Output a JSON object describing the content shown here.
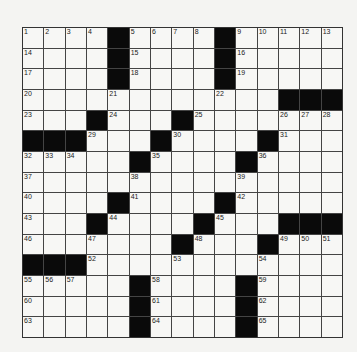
{
  "puzzle": {
    "rows": 15,
    "cols": 15,
    "black": [
      [
        4,
        9
      ],
      [
        4,
        9
      ],
      [
        4,
        9
      ],
      [
        12,
        13,
        14
      ],
      [
        3,
        7
      ],
      [
        0,
        1,
        2,
        6,
        11
      ],
      [
        5,
        10
      ],
      [],
      [
        4,
        9
      ],
      [
        3,
        8,
        12,
        13,
        14
      ],
      [
        7,
        11
      ],
      [
        0,
        1,
        2
      ],
      [
        5,
        10
      ],
      [
        5,
        10
      ],
      [
        5,
        10
      ]
    ],
    "numbers": [
      {
        "r": 0,
        "c": 0,
        "n": "1"
      },
      {
        "r": 0,
        "c": 1,
        "n": "2"
      },
      {
        "r": 0,
        "c": 2,
        "n": "3"
      },
      {
        "r": 0,
        "c": 3,
        "n": "4"
      },
      {
        "r": 0,
        "c": 5,
        "n": "5"
      },
      {
        "r": 0,
        "c": 6,
        "n": "6"
      },
      {
        "r": 0,
        "c": 7,
        "n": "7"
      },
      {
        "r": 0,
        "c": 8,
        "n": "8"
      },
      {
        "r": 0,
        "c": 10,
        "n": "9"
      },
      {
        "r": 0,
        "c": 11,
        "n": "10"
      },
      {
        "r": 0,
        "c": 12,
        "n": "11"
      },
      {
        "r": 0,
        "c": 13,
        "n": "12"
      },
      {
        "r": 0,
        "c": 14,
        "n": "13"
      },
      {
        "r": 1,
        "c": 0,
        "n": "14"
      },
      {
        "r": 1,
        "c": 5,
        "n": "15"
      },
      {
        "r": 1,
        "c": 10,
        "n": "16"
      },
      {
        "r": 2,
        "c": 0,
        "n": "17"
      },
      {
        "r": 2,
        "c": 5,
        "n": "18"
      },
      {
        "r": 2,
        "c": 10,
        "n": "19"
      },
      {
        "r": 3,
        "c": 0,
        "n": "20"
      },
      {
        "r": 3,
        "c": 4,
        "n": "21"
      },
      {
        "r": 3,
        "c": 9,
        "n": "22"
      },
      {
        "r": 4,
        "c": 0,
        "n": "23"
      },
      {
        "r": 4,
        "c": 4,
        "n": "24"
      },
      {
        "r": 4,
        "c": 8,
        "n": "25"
      },
      {
        "r": 4,
        "c": 12,
        "n": "26"
      },
      {
        "r": 4,
        "c": 13,
        "n": "27"
      },
      {
        "r": 4,
        "c": 14,
        "n": "28"
      },
      {
        "r": 5,
        "c": 3,
        "n": "29"
      },
      {
        "r": 5,
        "c": 7,
        "n": "30"
      },
      {
        "r": 5,
        "c": 12,
        "n": "31"
      },
      {
        "r": 6,
        "c": 0,
        "n": "32"
      },
      {
        "r": 6,
        "c": 1,
        "n": "33"
      },
      {
        "r": 6,
        "c": 2,
        "n": "34"
      },
      {
        "r": 6,
        "c": 6,
        "n": "35"
      },
      {
        "r": 6,
        "c": 11,
        "n": "36"
      },
      {
        "r": 7,
        "c": 0,
        "n": "37"
      },
      {
        "r": 7,
        "c": 5,
        "n": "38"
      },
      {
        "r": 7,
        "c": 10,
        "n": "39"
      },
      {
        "r": 8,
        "c": 0,
        "n": "40"
      },
      {
        "r": 8,
        "c": 5,
        "n": "41"
      },
      {
        "r": 8,
        "c": 10,
        "n": "42"
      },
      {
        "r": 9,
        "c": 0,
        "n": "43"
      },
      {
        "r": 9,
        "c": 4,
        "n": "44"
      },
      {
        "r": 9,
        "c": 9,
        "n": "45"
      },
      {
        "r": 10,
        "c": 0,
        "n": "46"
      },
      {
        "r": 10,
        "c": 3,
        "n": "47"
      },
      {
        "r": 10,
        "c": 8,
        "n": "48"
      },
      {
        "r": 10,
        "c": 12,
        "n": "49"
      },
      {
        "r": 10,
        "c": 13,
        "n": "50"
      },
      {
        "r": 10,
        "c": 14,
        "n": "51"
      },
      {
        "r": 11,
        "c": 3,
        "n": "52"
      },
      {
        "r": 11,
        "c": 7,
        "n": "53"
      },
      {
        "r": 11,
        "c": 11,
        "n": "54"
      },
      {
        "r": 12,
        "c": 0,
        "n": "55"
      },
      {
        "r": 12,
        "c": 1,
        "n": "56"
      },
      {
        "r": 12,
        "c": 2,
        "n": "57"
      },
      {
        "r": 12,
        "c": 6,
        "n": "58"
      },
      {
        "r": 12,
        "c": 11,
        "n": "59"
      },
      {
        "r": 13,
        "c": 0,
        "n": "60"
      },
      {
        "r": 13,
        "c": 6,
        "n": "61"
      },
      {
        "r": 13,
        "c": 11,
        "n": "62"
      },
      {
        "r": 14,
        "c": 0,
        "n": "63"
      },
      {
        "r": 14,
        "c": 6,
        "n": "64"
      },
      {
        "r": 14,
        "c": 11,
        "n": "65"
      }
    ]
  }
}
